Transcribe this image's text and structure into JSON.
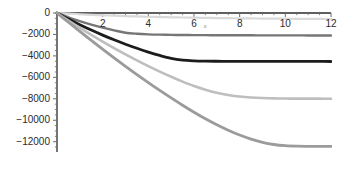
{
  "chart_data": {
    "type": "line",
    "title": "",
    "subtitle": "",
    "xlabel": "x",
    "ylabel": "",
    "xlim": [
      0,
      12
    ],
    "ylim": [
      -12800,
      300
    ],
    "grid": false,
    "legend": "none",
    "x_ticks": [
      2,
      4,
      6,
      8,
      10,
      12
    ],
    "x_tick_labels": [
      "2",
      "4",
      "6",
      "8",
      "10",
      "12"
    ],
    "y_ticks": [
      0,
      -2000,
      -4000,
      -6000,
      -8000,
      -10000,
      -12000
    ],
    "y_tick_labels": [
      "0",
      "-2000",
      "-4000",
      "-6000",
      "-8000",
      "-10000",
      "-12000"
    ],
    "x": [
      0,
      0.5,
      1,
      1.5,
      2,
      2.5,
      3,
      3.5,
      4,
      4.5,
      5,
      5.5,
      6,
      6.5,
      7,
      7.5,
      8,
      8.5,
      9,
      9.5,
      10,
      10.5,
      11,
      11.5,
      12
    ],
    "series": [
      {
        "name": "curve-1",
        "color": "#d9d9d9",
        "width": 2.2,
        "plateau": -400,
        "values": [
          0,
          -62,
          -118,
          -168,
          -213,
          -253,
          -289,
          -321,
          -350,
          -376,
          -399,
          -420,
          -438,
          -455,
          -470,
          -483,
          -495,
          -506,
          -516,
          -525,
          -533,
          -540,
          -546,
          -552,
          -558
        ]
      },
      {
        "name": "curve-2",
        "color": "#767676",
        "width": 2.4,
        "plateau": -2100,
        "values": [
          0,
          -400,
          -760,
          -1080,
          -1364,
          -1616,
          -1840,
          -1936,
          -1990,
          -2020,
          -2040,
          -2052,
          -2060,
          -2066,
          -2071,
          -2075,
          -2078,
          -2081,
          -2083,
          -2085,
          -2087,
          -2089,
          -2091,
          -2093,
          -2095
        ]
      },
      {
        "name": "curve-3",
        "color": "#1c1c1c",
        "width": 2.8,
        "plateau": -4520,
        "values": [
          0,
          -560,
          -1090,
          -1590,
          -2060,
          -2500,
          -2910,
          -3290,
          -3640,
          -3960,
          -4230,
          -4390,
          -4460,
          -4490,
          -4500,
          -4505,
          -4508,
          -4510,
          -4512,
          -4514,
          -4515,
          -4516,
          -4517,
          -4518,
          -4520
        ]
      },
      {
        "name": "curve-4",
        "color": "#bebebe",
        "width": 2.6,
        "plateau": -7990,
        "values": [
          0,
          -700,
          -1380,
          -2030,
          -2660,
          -3270,
          -3860,
          -4420,
          -4960,
          -5470,
          -5950,
          -6400,
          -6810,
          -7150,
          -7430,
          -7640,
          -7790,
          -7880,
          -7930,
          -7960,
          -7975,
          -7982,
          -7986,
          -7988,
          -7990
        ]
      },
      {
        "name": "curve-5",
        "color": "#9b9b9b",
        "width": 2.8,
        "plateau": -12430,
        "values": [
          0,
          -860,
          -1710,
          -2550,
          -3370,
          -4180,
          -4970,
          -5740,
          -6490,
          -7220,
          -7920,
          -8600,
          -9250,
          -9860,
          -10420,
          -10930,
          -11380,
          -11760,
          -12060,
          -12260,
          -12370,
          -12415,
          -12428,
          -12430,
          -12430
        ]
      }
    ],
    "annotations": [
      {
        "text": "x",
        "x": 6.5,
        "y": -1330
      }
    ]
  },
  "axis_style": {
    "axis_color": "#2b2b2b",
    "tick_color": "#6b6b6b",
    "background": "#ffffff"
  }
}
